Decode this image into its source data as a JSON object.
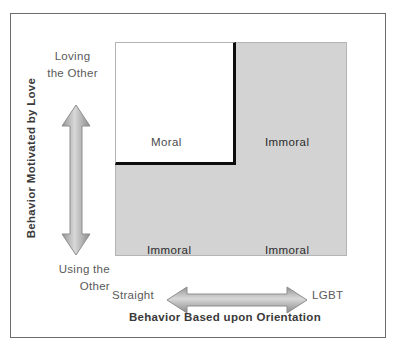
{
  "figure": {
    "type": "2x2-matrix-diagram",
    "y_axis": {
      "title": "Behavior Motivated by Love",
      "high_label_line1": "Loving",
      "high_label_line2": "the Other",
      "low_label_line1": "Using the",
      "low_label_line2": "Other"
    },
    "x_axis": {
      "title": "Behavior Based  upon Orientation",
      "left_label": "Straight",
      "right_label": "LGBT"
    },
    "quadrants": [
      {
        "id": "top-left",
        "label": "Moral",
        "fill": "#ffffff"
      },
      {
        "id": "top-right",
        "label": "Immoral",
        "fill": "#d3d3d3"
      },
      {
        "id": "bottom-left",
        "label": "Immoral",
        "fill": "#d3d3d3"
      },
      {
        "id": "bottom-right",
        "label": "Immoral",
        "fill": "#d3d3d3"
      }
    ],
    "colors": {
      "shaded": "#d3d3d3",
      "unshaded": "#ffffff",
      "highlight_border": "#0d0d0d",
      "arrow": "#9a9a9a",
      "frame": "#6b6b6b"
    },
    "icons": {
      "vertical_arrow": "double-headed-vertical-arrow",
      "horizontal_arrow": "double-headed-horizontal-arrow"
    }
  }
}
